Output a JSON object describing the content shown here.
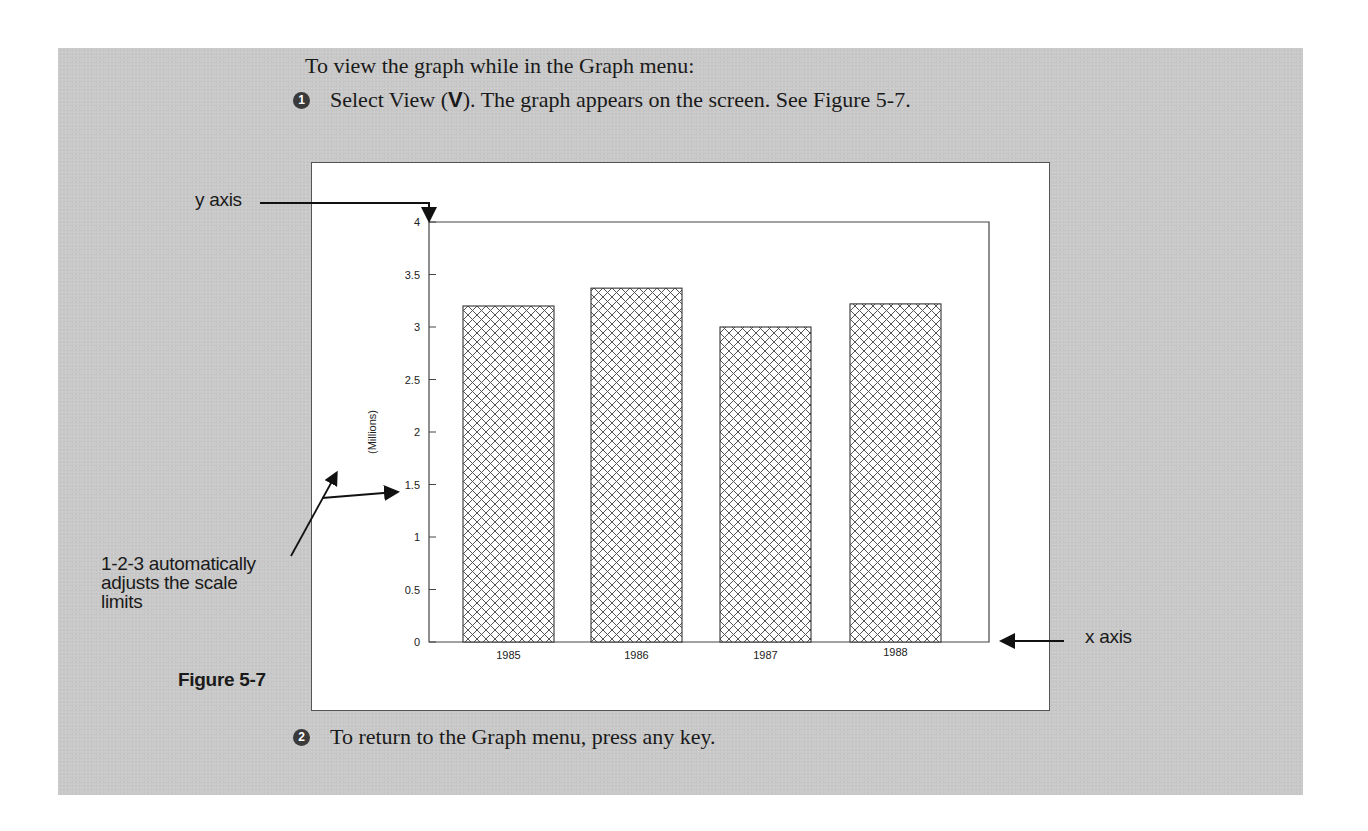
{
  "document": {
    "intro": "To view the graph while in the Graph menu:",
    "steps": [
      {
        "number": "1",
        "before": "Select View (",
        "key": "V",
        "after": "). The graph appears on the screen. See Figure 5-7."
      },
      {
        "number": "2",
        "text": "To return to the Graph menu, press any key."
      }
    ],
    "figure_label": "Figure 5-7",
    "callouts": {
      "y_axis": "y axis",
      "x_axis": "x axis",
      "scale_note_lines": [
        "1-2-3 automatically",
        "adjusts the scale",
        "limits"
      ]
    },
    "colors": {
      "panel_background": "#c9c9c9",
      "screen_background": "#ffffff",
      "ink": "#1a1a1a"
    }
  },
  "chart_data": {
    "type": "bar",
    "title": "",
    "categories": [
      "1985",
      "1986",
      "1987",
      "1988"
    ],
    "values": [
      3.2,
      3.37,
      3.0,
      3.22
    ],
    "xlabel": "",
    "ylabel": "(Millions)",
    "ylim": [
      0,
      4
    ],
    "yticks": [
      "0",
      "0.5",
      "1",
      "1.5",
      "2",
      "2.5",
      "3",
      "3.5",
      "4"
    ],
    "grid": false,
    "legend": null,
    "bar_fill": "crosshatch"
  }
}
